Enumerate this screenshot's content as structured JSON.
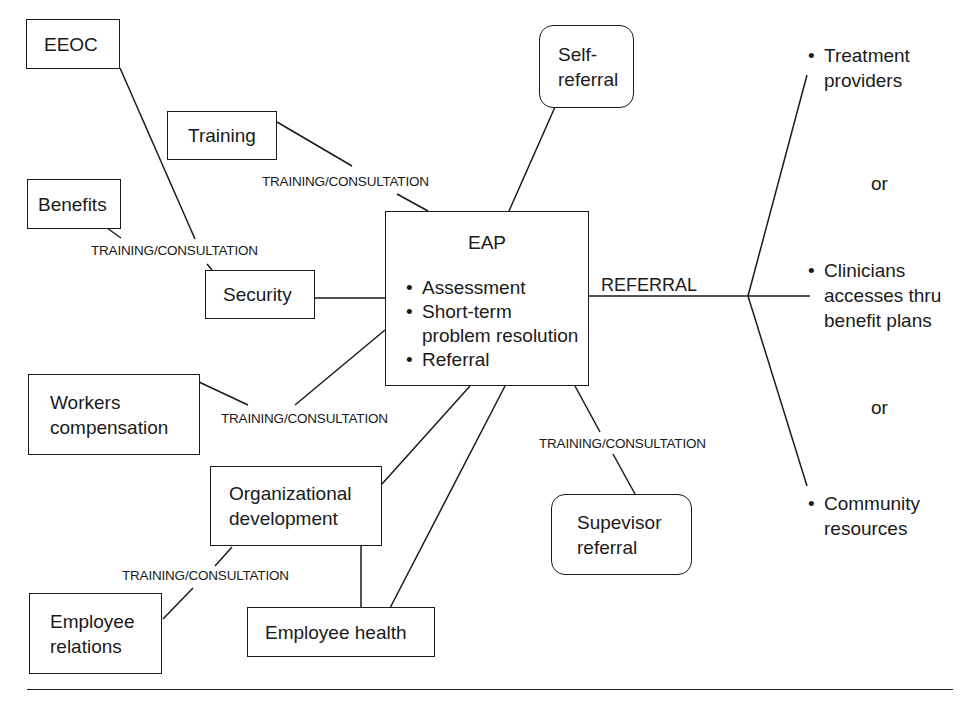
{
  "diagram": {
    "center": {
      "title": "EAP",
      "bullets": [
        "Assessment",
        "Short-term problem resolution",
        "Referral"
      ]
    },
    "nodes": {
      "eeoc": "EEOC",
      "training": "Training",
      "benefits": "Benefits",
      "security": "Security",
      "workers_comp": [
        "Workers",
        "compensation"
      ],
      "org_dev": [
        "Organizational",
        "development"
      ],
      "employee_relations": [
        "Employee",
        "relations"
      ],
      "employee_health": "Employee health",
      "self_referral": [
        "Self-",
        "referral"
      ],
      "supervisor_referral": [
        "Supevisor",
        "referral"
      ]
    },
    "edge_labels": {
      "training_consultation": "TRAINING/CONSULTATION",
      "referral": "REFERRAL"
    },
    "referral_targets": [
      {
        "lines": [
          "Treatment",
          "providers"
        ]
      },
      {
        "lines": [
          "Clinicians",
          "accesses thru",
          "benefit plans"
        ]
      },
      {
        "lines": [
          "Community",
          "resources"
        ]
      }
    ],
    "separator": "or",
    "bullet_char": "•"
  }
}
